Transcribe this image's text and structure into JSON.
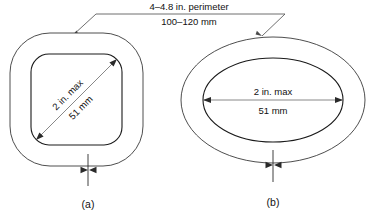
{
  "diagram": {
    "perimeter_note": {
      "line1": "4–4.8 in. perimeter",
      "line2": "100–120 mm"
    },
    "figures": [
      {
        "id": "a",
        "caption": "(a)",
        "shape": "rounded-square",
        "dimension": {
          "orientation": "diagonal",
          "line1": "2 in. max",
          "line2": "51 mm"
        }
      },
      {
        "id": "b",
        "caption": "(b)",
        "shape": "ellipse",
        "dimension": {
          "orientation": "horizontal",
          "line1": "2 in. max",
          "line2": "51 mm"
        }
      }
    ],
    "colors": {
      "outline": "#3a3a3a",
      "inner_outline": "#1a1a1a",
      "dimension_line": "#6a6a6a",
      "leader": "#4a4a4a",
      "text": "#111111",
      "background": "#ffffff"
    }
  }
}
